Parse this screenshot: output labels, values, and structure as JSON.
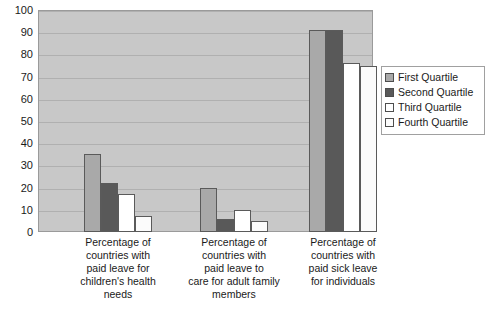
{
  "chart_data": {
    "type": "bar",
    "title": "",
    "subtitle": "",
    "xlabel": "",
    "ylabel": "",
    "ylim": [
      0,
      100
    ],
    "ytick_labels": [
      "100",
      "90",
      "80",
      "70",
      "60",
      "50",
      "40",
      "30",
      "20",
      "10",
      "0"
    ],
    "ytick_values": [
      100,
      90,
      80,
      70,
      60,
      50,
      40,
      30,
      20,
      10,
      0
    ],
    "grid": true,
    "legend_position": "right",
    "categories": [
      "Percentage of countries with paid leave for children's health needs",
      "Percentage of countries with paid leave to care for adult family members",
      "Percentage of countries with paid sick leave for individuals"
    ],
    "category_lines": [
      [
        "Percentage of",
        "countries with",
        "paid leave for",
        "children's health",
        "needs"
      ],
      [
        "Percentage of",
        "countries with",
        "paid leave to",
        "care for adult family",
        "members"
      ],
      [
        "Percentage of",
        "countries with",
        "paid sick leave",
        "for individuals"
      ]
    ],
    "series": [
      {
        "name": "First Quartile",
        "color": "#a9a9a9",
        "values": [
          35,
          20,
          91
        ]
      },
      {
        "name": "Second Quartile",
        "color": "#595959",
        "values": [
          22,
          6,
          91
        ]
      },
      {
        "name": "Third Quartile",
        "color": "#ffffff",
        "values": [
          17,
          10,
          76
        ]
      },
      {
        "name": "Fourth Quartile",
        "color": "#fbfbfb",
        "values": [
          7,
          5,
          75
        ]
      }
    ]
  },
  "legend": {
    "items": [
      {
        "label": "First Quartile"
      },
      {
        "label": "Second Quartile"
      },
      {
        "label": "Third Quartile"
      },
      {
        "label": "Fourth Quartile"
      }
    ]
  },
  "plot": {
    "background_color": "#c8c8c8",
    "gridline_color": "#b0b0b0",
    "border_color": "#9a9a9a"
  }
}
